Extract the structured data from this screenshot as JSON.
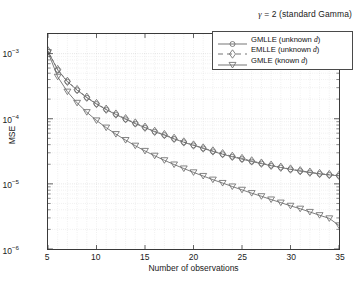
{
  "figure": {
    "title": "γ = 2 (standard Gamma)",
    "title_symbol": "γ",
    "title_rest": " = 2 (standard Gamma)",
    "background_color": "#ffffff",
    "axes_color": "#3a3a3a",
    "grid_color": "#c9c9c9",
    "series_color": "#6e6e6e"
  },
  "axes": {
    "xlabel": "Number of observations",
    "ylabel": "MSE",
    "xticks": [
      5,
      10,
      15,
      20,
      25,
      30,
      35
    ],
    "xtick_labels": [
      "5",
      "10",
      "15",
      "20",
      "25",
      "30",
      "35"
    ],
    "xlim": [
      5,
      35
    ],
    "ytick_labels": [
      "10",
      "10",
      "10",
      "10"
    ],
    "ytick_exponents": [
      "-3",
      "-4",
      "-5",
      "-6"
    ],
    "ylim": [
      1e-06,
      0.002
    ],
    "yscale": "log",
    "grid": true
  },
  "legend": {
    "position": "top-right-inside",
    "entries": [
      {
        "label": "GMLLE (unknown ",
        "italic": "d",
        "suffix": ")",
        "marker": "circle",
        "linestyle": "solid",
        "name": "GMLLE"
      },
      {
        "label": "EMLLE (unknown ",
        "italic": "d",
        "suffix": ")",
        "marker": "diamond",
        "linestyle": "dashed",
        "name": "EMLLE"
      },
      {
        "label": "GMLE (known ",
        "italic": "d",
        "suffix": ")",
        "marker": "triangle-down",
        "linestyle": "solid",
        "name": "GMLE"
      }
    ]
  },
  "chart_data": {
    "type": "line",
    "title": "γ = 2 (standard Gamma)",
    "xlabel": "Number of observations",
    "ylabel": "MSE",
    "yscale": "log",
    "xlim": [
      5,
      35
    ],
    "ylim": [
      1e-06,
      0.002
    ],
    "grid": true,
    "legend_position": "top-right-inside",
    "x": [
      5,
      6,
      7,
      8,
      9,
      10,
      11,
      12,
      13,
      14,
      15,
      16,
      17,
      18,
      19,
      20,
      21,
      22,
      23,
      24,
      25,
      26,
      27,
      28,
      29,
      30,
      31,
      32,
      33,
      34,
      35
    ],
    "series": [
      {
        "name": "GMLLE (unknown d)",
        "marker": "circle",
        "linestyle": "solid",
        "color": "#6e6e6e",
        "values": [
          0.00108,
          0.00056,
          0.00037,
          0.000275,
          0.00021,
          0.000168,
          0.000138,
          0.000116,
          9.8e-05,
          8.4e-05,
          7.3e-05,
          6.3e-05,
          5.6e-05,
          4.9e-05,
          4.35e-05,
          3.9e-05,
          3.5e-05,
          3.15e-05,
          2.85e-05,
          2.6e-05,
          2.4e-05,
          2.2e-05,
          2.05e-05,
          1.9e-05,
          1.78e-05,
          1.67e-05,
          1.57e-05,
          1.49e-05,
          1.42e-05,
          1.37e-05,
          1.33e-05
        ]
      },
      {
        "name": "EMLLE (unknown d)",
        "marker": "diamond",
        "linestyle": "dashed",
        "color": "#6e6e6e",
        "values": [
          0.0011,
          0.00057,
          0.000375,
          0.00028,
          0.000214,
          0.000171,
          0.00014,
          0.000118,
          0.0001,
          8.6e-05,
          7.4e-05,
          6.4e-05,
          5.7e-05,
          5e-05,
          4.4e-05,
          3.95e-05,
          3.55e-05,
          3.2e-05,
          2.9e-05,
          2.65e-05,
          2.45e-05,
          2.25e-05,
          2.08e-05,
          1.93e-05,
          1.8e-05,
          1.69e-05,
          1.59e-05,
          1.51e-05,
          1.44e-05,
          1.39e-05,
          1.35e-05
        ]
      },
      {
        "name": "GMLE (known d)",
        "marker": "triangle-down",
        "linestyle": "solid",
        "color": "#6e6e6e",
        "values": [
          0.00105,
          0.00044,
          0.00026,
          0.000175,
          0.000126,
          9.4e-05,
          7.3e-05,
          5.8e-05,
          4.7e-05,
          3.85e-05,
          3.2e-05,
          2.7e-05,
          2.3e-05,
          1.98e-05,
          1.72e-05,
          1.5e-05,
          1.32e-05,
          1.16e-05,
          1.03e-05,
          9.1e-06,
          8.1e-06,
          7.2e-06,
          6.45e-06,
          5.75e-06,
          5.15e-06,
          4.6e-06,
          4.15e-06,
          3.7e-06,
          3.3e-06,
          2.95e-06,
          2.3e-06
        ]
      }
    ]
  }
}
